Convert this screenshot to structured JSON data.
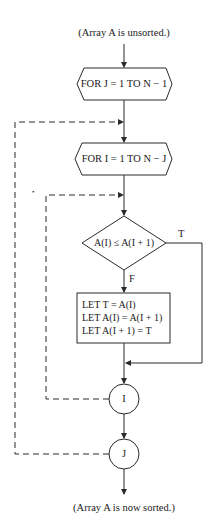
{
  "flowchart": {
    "start_label": "(Array A is unsorted.)",
    "outer_loop": "FOR J = 1 TO N − 1",
    "inner_loop": "FOR I = 1 TO N − J",
    "decision": "A(I) ≤ A(I + 1)",
    "true_label": "T",
    "false_label": "F",
    "process_lines": [
      "LET T = A(I)",
      "LET A(I) = A(I + 1)",
      "LET A(I + 1) = T"
    ],
    "inner_next": "I",
    "outer_next": "J",
    "end_label": "(Array A is now sorted.)",
    "stray_mark": "•"
  },
  "colors": {
    "line": "#2a2a2a",
    "background": "#ffffff"
  }
}
